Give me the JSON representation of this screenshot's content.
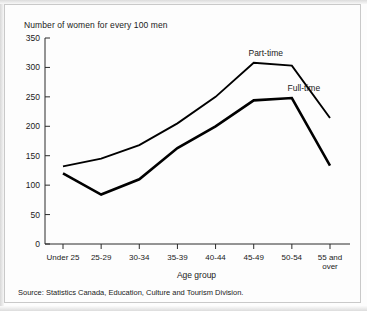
{
  "chart_data": {
    "type": "line",
    "title": "Number of women for every 100 men",
    "xlabel": "Age group",
    "ylabel": "",
    "categories": [
      "Under 25",
      "25-29",
      "30-34",
      "35-39",
      "40-44",
      "45-49",
      "50-54",
      "55 and over"
    ],
    "series": [
      {
        "name": "Part-time",
        "values": [
          132,
          145,
          168,
          205,
          250,
          308,
          303,
          214
        ],
        "color": "#000000"
      },
      {
        "name": "Full-time",
        "values": [
          120,
          84,
          110,
          163,
          200,
          244,
          248,
          133
        ],
        "color": "#000000"
      }
    ],
    "ylim": [
      0,
      350
    ],
    "yticks": [
      "0",
      "50",
      "100",
      "150",
      "200",
      "250",
      "300",
      "350"
    ],
    "grid": false,
    "legend_position": "inline-annotations"
  },
  "source": {
    "text": "Source: Statistics Canada, Education, Culture and Tourism Division."
  },
  "xtick_lines": [
    [
      "Under 25"
    ],
    [
      "25-29"
    ],
    [
      "30-34"
    ],
    [
      "35-39"
    ],
    [
      "40-44"
    ],
    [
      "45-49"
    ],
    [
      "50-54"
    ],
    [
      "55 and",
      "over"
    ]
  ]
}
